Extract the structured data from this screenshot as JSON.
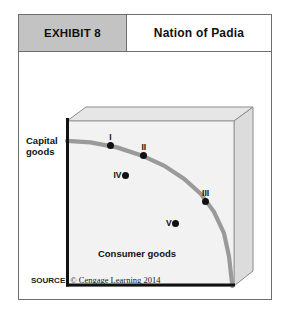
{
  "exhibit": {
    "number_label": "EXHIBIT 8",
    "title": "Nation of Padia"
  },
  "source": {
    "key": "SOURCE:",
    "value": "© Cengage Learning 2014"
  },
  "colors": {
    "header_gray": "#c3c3c3",
    "frame_border": "#6e6e6e",
    "plot_face": "#f2f2f2",
    "box_side": "#e3e3e3",
    "curve": "#9a9a9a",
    "axis": "#111111",
    "dot": "#111111"
  },
  "chart_data": {
    "type": "line",
    "title": "Nation of Padia",
    "xlabel": "Consumer goods",
    "ylabel": "Capital goods",
    "grid": false,
    "legend": null,
    "axis_ticks": {
      "x": [],
      "y": []
    },
    "curve_name": "Production possibilities frontier",
    "curve_points": [
      {
        "x": 0,
        "y": 88
      },
      {
        "x": 14,
        "y": 87
      },
      {
        "x": 30,
        "y": 84
      },
      {
        "x": 45,
        "y": 79
      },
      {
        "x": 58,
        "y": 73
      },
      {
        "x": 70,
        "y": 65
      },
      {
        "x": 80,
        "y": 56
      },
      {
        "x": 88,
        "y": 45
      },
      {
        "x": 94,
        "y": 32
      },
      {
        "x": 97,
        "y": 18
      },
      {
        "x": 99,
        "y": 0
      }
    ],
    "annotations": [
      {
        "label": "I",
        "x": 26,
        "y": 85,
        "on_curve": true,
        "label_pos": "above"
      },
      {
        "label": "II",
        "x": 46,
        "y": 79,
        "on_curve": true,
        "label_pos": "above"
      },
      {
        "label": "III",
        "x": 83,
        "y": 51,
        "on_curve": true,
        "label_pos": "above"
      },
      {
        "label": "IV",
        "x": 35,
        "y": 67,
        "on_curve": false,
        "label_pos": "left"
      },
      {
        "label": "V",
        "x": 65,
        "y": 38,
        "on_curve": false,
        "label_pos": "left"
      }
    ]
  }
}
